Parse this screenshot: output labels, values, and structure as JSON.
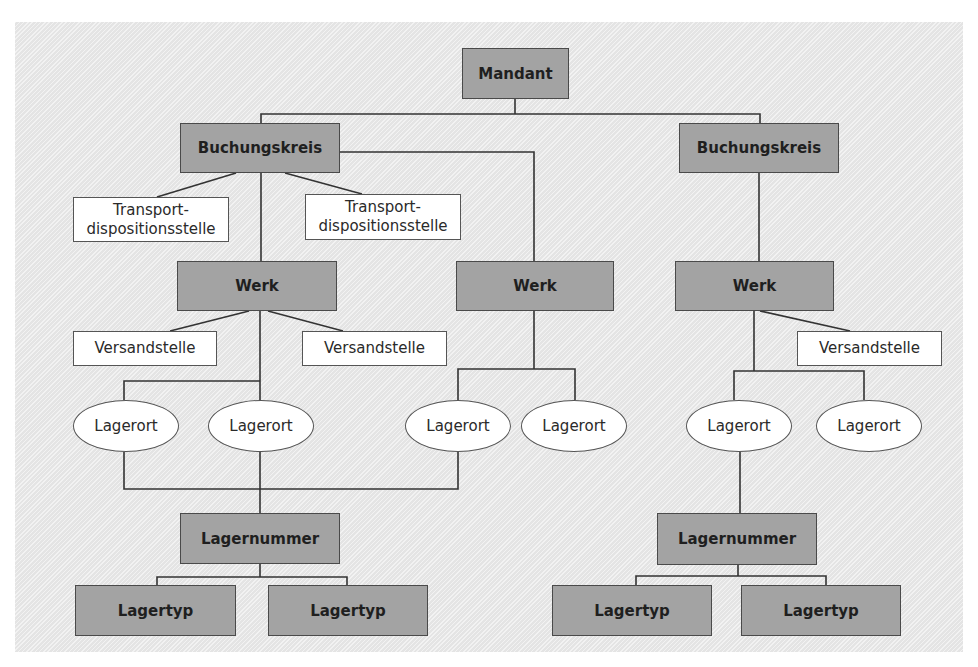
{
  "diagram": {
    "colors": {
      "dark_node": "#a3a3a3",
      "light_node": "#ffffff",
      "background": "#ebebeb",
      "line": "#333333"
    },
    "nodes": {
      "mandant": "Mandant",
      "buchungskreis_1": "Buchungskreis",
      "buchungskreis_2": "Buchungskreis",
      "transport_1": "Transport-\ndispositionsstelle",
      "transport_2": "Transport-\ndispositionsstelle",
      "werk_1": "Werk",
      "werk_2": "Werk",
      "werk_3": "Werk",
      "versand_1": "Versandstelle",
      "versand_2": "Versandstelle",
      "versand_3": "Versandstelle",
      "lagerort_1": "Lagerort",
      "lagerort_2": "Lagerort",
      "lagerort_3": "Lagerort",
      "lagerort_4": "Lagerort",
      "lagerort_5": "Lagerort",
      "lagerort_6": "Lagerort",
      "lagernummer_1": "Lagernummer",
      "lagernummer_2": "Lagernummer",
      "lagertyp_1": "Lagertyp",
      "lagertyp_2": "Lagertyp",
      "lagertyp_3": "Lagertyp",
      "lagertyp_4": "Lagertyp"
    },
    "edges": [
      [
        "mandant",
        "buchungskreis_1"
      ],
      [
        "mandant",
        "buchungskreis_2"
      ],
      [
        "buchungskreis_1",
        "transport_1"
      ],
      [
        "buchungskreis_1",
        "transport_2"
      ],
      [
        "buchungskreis_1",
        "werk_1"
      ],
      [
        "buchungskreis_1",
        "werk_2"
      ],
      [
        "buchungskreis_2",
        "werk_3"
      ],
      [
        "werk_1",
        "versand_1"
      ],
      [
        "werk_1",
        "versand_2"
      ],
      [
        "werk_3",
        "versand_3"
      ],
      [
        "werk_1",
        "lagerort_1"
      ],
      [
        "werk_1",
        "lagerort_2"
      ],
      [
        "werk_2",
        "lagerort_3"
      ],
      [
        "werk_2",
        "lagerort_4"
      ],
      [
        "werk_3",
        "lagerort_5"
      ],
      [
        "werk_3",
        "lagerort_6"
      ],
      [
        "lagerort_1",
        "lagernummer_1"
      ],
      [
        "lagerort_2",
        "lagernummer_1"
      ],
      [
        "lagerort_3",
        "lagernummer_1"
      ],
      [
        "lagerort_5",
        "lagernummer_2"
      ],
      [
        "lagernummer_1",
        "lagertyp_1"
      ],
      [
        "lagernummer_1",
        "lagertyp_2"
      ],
      [
        "lagernummer_2",
        "lagertyp_3"
      ],
      [
        "lagernummer_2",
        "lagertyp_4"
      ]
    ]
  }
}
